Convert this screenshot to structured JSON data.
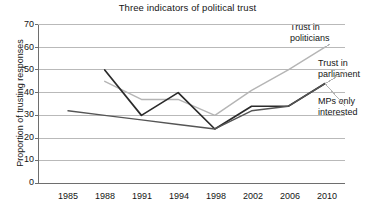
{
  "chart_data": {
    "type": "line",
    "title": "Three indicators of political trust",
    "xlabel": "",
    "ylabel": "Proportion of trusting responses",
    "categories": [
      "1985",
      "1988",
      "1991",
      "1994",
      "1998",
      "2002",
      "2006",
      "2010"
    ],
    "x_positions": [
      1985,
      1988,
      1991,
      1994,
      1998,
      2002,
      2006,
      2010
    ],
    "ylim": [
      0,
      70
    ],
    "yticks": [
      0,
      10,
      20,
      30,
      40,
      50,
      60,
      70
    ],
    "grid": "horizontal",
    "legend": "inline-annotations",
    "series": [
      {
        "name": "Trust in politicians",
        "color": "#b5b5b5",
        "values": [
          null,
          45,
          37,
          37,
          30,
          41,
          50,
          60
        ]
      },
      {
        "name": "Trust in parliament",
        "color": "#2b2b2b",
        "values": [
          null,
          50,
          30,
          40,
          24,
          34,
          34,
          44
        ]
      },
      {
        "name": "MPs only interested",
        "color": "#555555",
        "values": [
          32,
          30,
          28,
          26,
          24,
          32,
          34,
          44
        ]
      }
    ],
    "annotations": [
      {
        "label_line1": "Trust in",
        "label_line2": "politicians"
      },
      {
        "label_line1": "Trust in",
        "label_line2": "parliament"
      },
      {
        "label_line1": "MPs only",
        "label_line2": "interested"
      }
    ]
  },
  "axes": {
    "y_tick_labels": [
      "70",
      "60",
      "50",
      "40",
      "30",
      "20",
      "10",
      "0"
    ],
    "x_tick_labels": [
      "1985",
      "1988",
      "1991",
      "1994",
      "1998",
      "2002",
      "2006",
      "2010"
    ]
  },
  "colors": {
    "grid": "#b9b9b9",
    "axis": "#6e6e6e",
    "politicians": "#b5b5b5",
    "parliament": "#2b2b2b",
    "mps": "#555555",
    "text": "#151515",
    "background": "#ffffff"
  }
}
